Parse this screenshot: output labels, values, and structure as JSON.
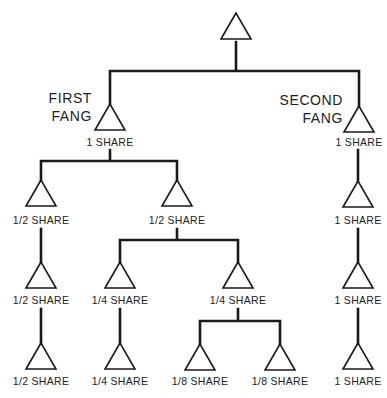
{
  "diagram": {
    "type": "inheritance-tree",
    "stroke_color": "#1a1a1a",
    "background": "#ffffff",
    "root": {
      "id": "root",
      "x": 236,
      "label": ""
    },
    "fang_labels": [
      {
        "id": "first-fang",
        "lines": [
          "FIRST",
          "FANG"
        ],
        "x": 92,
        "y": [
          103,
          121
        ]
      },
      {
        "id": "second-fang",
        "lines": [
          "SECOND",
          "FANG"
        ],
        "x": 343,
        "y": [
          105,
          123
        ]
      }
    ],
    "nodes": [
      {
        "id": "root",
        "x": 236,
        "top": 13,
        "label": "",
        "label_y": null
      },
      {
        "id": "f1",
        "x": 110,
        "top": 104,
        "label": "1 SHARE",
        "label_y": 146
      },
      {
        "id": "f2",
        "x": 359,
        "top": 106,
        "label": "1 SHARE",
        "label_y": 146
      },
      {
        "id": "a",
        "x": 41,
        "top": 180,
        "label": "1/2 SHARE",
        "label_y": 224
      },
      {
        "id": "b",
        "x": 177,
        "top": 180,
        "label": "1/2 SHARE",
        "label_y": 224
      },
      {
        "id": "s1",
        "x": 358,
        "top": 181,
        "label": "1 SHARE",
        "label_y": 224
      },
      {
        "id": "a1",
        "x": 41,
        "top": 262,
        "label": "1/2 SHARE",
        "label_y": 304
      },
      {
        "id": "b1",
        "x": 120,
        "top": 262,
        "label": "1/4 SHARE",
        "label_y": 304
      },
      {
        "id": "b2",
        "x": 238,
        "top": 262,
        "label": "1/4 SHARE",
        "label_y": 304
      },
      {
        "id": "s2",
        "x": 358,
        "top": 262,
        "label": "1 SHARE",
        "label_y": 304
      },
      {
        "id": "a2",
        "x": 41,
        "top": 343,
        "label": "1/2 SHARE",
        "label_y": 385
      },
      {
        "id": "b11",
        "x": 120,
        "top": 343,
        "label": "1/4 SHARE",
        "label_y": 385
      },
      {
        "id": "b21",
        "x": 200,
        "top": 344,
        "label": "1/8 SHARE",
        "label_y": 385
      },
      {
        "id": "b22",
        "x": 280,
        "top": 344,
        "label": "1/8 SHARE",
        "label_y": 385
      },
      {
        "id": "s3",
        "x": 358,
        "top": 343,
        "label": "1 SHARE",
        "label_y": 385
      }
    ],
    "edges": [
      {
        "from": "root",
        "to": [
          "f1",
          "f2"
        ],
        "bar_y": 71,
        "start_y": 42
      },
      {
        "from": "f1",
        "to": [
          "a",
          "b"
        ],
        "bar_y": 161,
        "start_y": 150
      },
      {
        "from": "f2",
        "to": [
          "s1"
        ],
        "bar_y": null,
        "start_y": 150
      },
      {
        "from": "a",
        "to": [
          "a1"
        ],
        "bar_y": null,
        "start_y": 229
      },
      {
        "from": "b",
        "to": [
          "b1",
          "b2"
        ],
        "bar_y": 240,
        "start_y": 229
      },
      {
        "from": "s1",
        "to": [
          "s2"
        ],
        "bar_y": null,
        "start_y": 229
      },
      {
        "from": "a1",
        "to": [
          "a2"
        ],
        "bar_y": null,
        "start_y": 309
      },
      {
        "from": "b1",
        "to": [
          "b11"
        ],
        "bar_y": null,
        "start_y": 309
      },
      {
        "from": "b2",
        "to": [
          "b21",
          "b22"
        ],
        "bar_y": 321,
        "start_y": 309
      },
      {
        "from": "s2",
        "to": [
          "s3"
        ],
        "bar_y": null,
        "start_y": 309
      }
    ],
    "triangle": {
      "height": 26,
      "half_width": 15
    }
  }
}
